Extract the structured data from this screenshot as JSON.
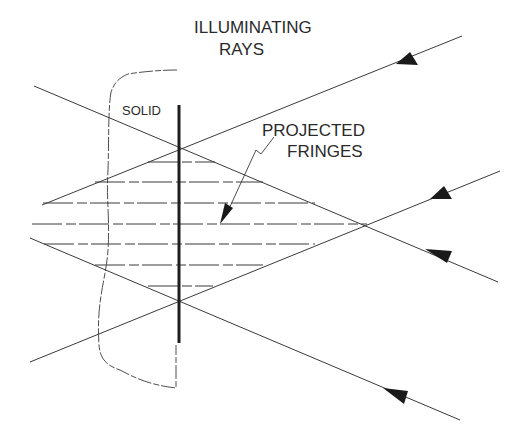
{
  "labels": {
    "illuminating_line1": "ILLUMINATING",
    "illuminating_line2": "RAYS",
    "solid": "SOLID",
    "projected_line1": "PROJECTED",
    "projected_line2": "FRINGES"
  },
  "colors": {
    "line": "#3a3a3a",
    "bar": "#1e1e1e",
    "arrowhead": "#1a1a1a",
    "text": "#2a2a2a",
    "background": "#ffffff"
  },
  "geometry": {
    "surface_bar": {
      "x": 179,
      "y1": 105,
      "y2": 343
    },
    "upper_crossing": [
      179,
      147
    ],
    "lower_crossing": [
      179,
      301
    ],
    "right_apex": [
      367,
      224
    ],
    "fringe_y": [
      162,
      182,
      203,
      224,
      244,
      265,
      286
    ],
    "rays": [
      {
        "from": [
          34,
          86
        ],
        "to": [
          498,
          282
        ],
        "arrow_at": [
          445,
          258
        ]
      },
      {
        "from": [
          42,
          205
        ],
        "to": [
          462,
          36
        ],
        "arrow_at": [
          415,
          56
        ]
      },
      {
        "from": [
          30,
          362
        ],
        "to": [
          500,
          171
        ],
        "arrow_at": [
          448,
          191
        ]
      },
      {
        "from": [
          30,
          238
        ],
        "to": [
          460,
          420
        ],
        "arrow_at": [
          402,
          396
        ]
      }
    ]
  }
}
